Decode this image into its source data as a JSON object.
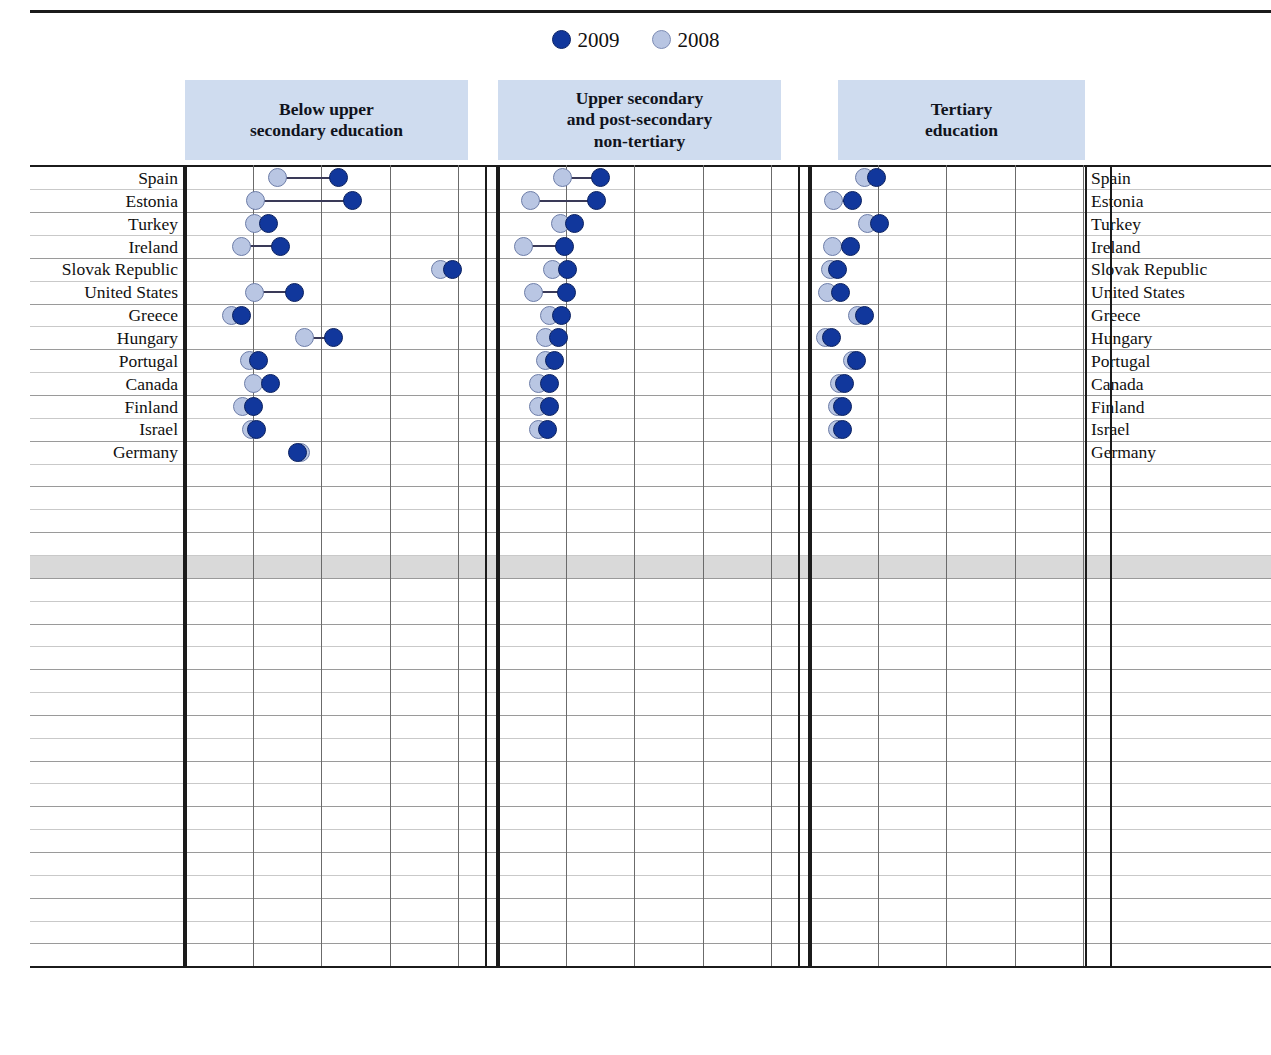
{
  "legend": {
    "items": [
      {
        "label": "2009",
        "color": "#11379c",
        "icon": "filled-circle-icon"
      },
      {
        "label": "2008",
        "color": "#b9c6e3",
        "icon": "light-circle-icon"
      }
    ]
  },
  "panels": [
    {
      "id": "below-upper-secondary",
      "title": "Below upper\nsecondary education",
      "title_line1": "Below upper",
      "title_line2": "secondary education"
    },
    {
      "id": "upper-secondary-post-secondary-non-tertiary",
      "title_line1": "Upper secondary",
      "title_line2": "and post-secondary",
      "title_line3": "non-tertiary"
    },
    {
      "id": "tertiary-education",
      "title_line1": "Tertiary",
      "title_line2": "education"
    }
  ],
  "axis": {
    "ticks": [
      "0",
      "10",
      "20",
      "30",
      "40"
    ],
    "tick_values": [
      0,
      10,
      20,
      30,
      40
    ],
    "title": "Percentage points",
    "min": 0,
    "max": 44
  },
  "highlight_row": "OECD average",
  "chart_data": {
    "type": "scatter",
    "title": "",
    "xlabel": "Percentage points",
    "ylabel": "",
    "xlim": [
      0,
      44
    ],
    "grid": true,
    "legend_position": "top",
    "series": [
      "2008",
      "2009"
    ],
    "panels": [
      "Below upper secondary education",
      "Upper secondary and post-secondary non-tertiary",
      "Tertiary education"
    ],
    "categories": [
      "Spain",
      "Estonia",
      "Turkey",
      "Ireland",
      "Slovak Republic",
      "United States",
      "Greece",
      "Hungary",
      "Portugal",
      "Canada",
      "Finland",
      "Israel",
      "Germany",
      "Chile",
      "Poland",
      "Brazil",
      "France",
      "OECD average",
      "Belgium",
      "Sweden",
      "Japan",
      "Italy",
      "Slovenia",
      "Czech Republic",
      "Denmark",
      "Mexico",
      "Australia",
      "New Zealand",
      "Korea",
      "Austria",
      "United Kingdom",
      "Luxembourg",
      "Switzerland",
      "Netherlands",
      "Norway"
    ],
    "rows": [
      {
        "country": "Spain",
        "below": {
          "y2008": 13.5,
          "y2009": 22.5
        },
        "upper": {
          "y2008": 9.5,
          "y2009": 15.0
        },
        "tertiary": {
          "y2008": 8.0,
          "y2009": 9.8
        }
      },
      {
        "country": "Estonia",
        "below": {
          "y2008": 10.3,
          "y2009": 24.5
        },
        "upper": {
          "y2008": 4.8,
          "y2009": 14.5
        },
        "tertiary": {
          "y2008": 3.5,
          "y2009": 6.3
        }
      },
      {
        "country": "Turkey",
        "below": {
          "y2008": 10.2,
          "y2009": 12.2
        },
        "upper": {
          "y2008": 9.2,
          "y2009": 11.2
        },
        "tertiary": {
          "y2008": 8.5,
          "y2009": 10.2
        }
      },
      {
        "country": "Ireland",
        "below": {
          "y2008": 8.3,
          "y2009": 14.0
        },
        "upper": {
          "y2008": 3.8,
          "y2009": 9.8
        },
        "tertiary": {
          "y2008": 3.3,
          "y2009": 6.0
        }
      },
      {
        "country": "Slovak Republic",
        "below": {
          "y2008": 37.5,
          "y2009": 39.2
        },
        "upper": {
          "y2008": 8.0,
          "y2009": 10.2
        },
        "tertiary": {
          "y2008": 3.0,
          "y2009": 4.0
        }
      },
      {
        "country": "United States",
        "below": {
          "y2008": 10.2,
          "y2009": 16.0
        },
        "upper": {
          "y2008": 5.2,
          "y2009": 10.0
        },
        "tertiary": {
          "y2008": 2.5,
          "y2009": 4.5
        }
      },
      {
        "country": "Greece",
        "below": {
          "y2008": 6.8,
          "y2009": 8.3
        },
        "upper": {
          "y2008": 7.5,
          "y2009": 9.3
        },
        "tertiary": {
          "y2008": 7.0,
          "y2009": 8.0
        }
      },
      {
        "country": "Hungary",
        "below": {
          "y2008": 17.5,
          "y2009": 21.8
        },
        "upper": {
          "y2008": 7.0,
          "y2009": 8.8
        },
        "tertiary": {
          "y2008": 2.3,
          "y2009": 3.2
        }
      },
      {
        "country": "Portugal",
        "below": {
          "y2008": 9.5,
          "y2009": 10.8
        },
        "upper": {
          "y2008": 7.0,
          "y2009": 8.3
        },
        "tertiary": {
          "y2008": 6.3,
          "y2009": 6.8
        }
      },
      {
        "country": "Canada",
        "below": {
          "y2008": 10.0,
          "y2009": 12.5
        },
        "upper": {
          "y2008": 6.0,
          "y2009": 7.5
        },
        "tertiary": {
          "y2008": 4.3,
          "y2009": 5.0
        }
      },
      {
        "country": "Finland",
        "below": {
          "y2008": 8.5,
          "y2009": 10.0
        },
        "upper": {
          "y2008": 6.0,
          "y2009": 7.5
        },
        "tertiary": {
          "y2008": 4.0,
          "y2009": 4.8
        }
      },
      {
        "country": "Israel",
        "below": {
          "y2008": 9.7,
          "y2009": 10.5
        },
        "upper": {
          "y2008": 6.0,
          "y2009": 7.2
        },
        "tertiary": {
          "y2008": 4.0,
          "y2009": 4.8
        }
      },
      {
        "country": "Germany",
        "below": {
          "y2008": 17.0,
          "y2009": 16.5
        },
        "upper": {
          "y2008": 6.3,
          "y2009": 6.0
        },
        "tertiary": {
          "y2008": 3.3,
          "y2009": 3.0
        }
      },
      {
        "country": "Chile",
        "below": {
          "y2008": 5.0,
          "y2009": 5.5
        },
        "upper": {
          "y2008": 6.5,
          "y2009": 7.2
        },
        "tertiary": {
          "y2008": 8.3,
          "y2009": 9.7
        }
      },
      {
        "country": "Poland",
        "below": {
          "y2008": 10.3,
          "y2009": 11.7
        },
        "upper": {
          "y2008": 6.8,
          "y2009": 7.3
        },
        "tertiary": {
          "y2008": 3.8,
          "y2009": 4.2
        }
      },
      {
        "country": "Brazil",
        "below": {
          "y2008": 4.8,
          "y2009": 5.3
        },
        "upper": {
          "y2008": 6.0,
          "y2009": 6.5
        },
        "tertiary": {
          "y2008": 3.0,
          "y2009": 3.3
        }
      },
      {
        "country": "France",
        "below": {
          "y2008": 9.8,
          "y2009": 11.3
        },
        "upper": {
          "y2008": 6.0,
          "y2009": 6.8
        },
        "tertiary": {
          "y2008": 4.5,
          "y2009": 5.2
        }
      },
      {
        "country": "OECD average",
        "below": {
          "y2008": 9.3,
          "y2009": 11.0
        },
        "upper": {
          "y2008": 5.7,
          "y2009": 6.8
        },
        "tertiary": {
          "y2008": 3.3,
          "y2009": 4.0
        }
      },
      {
        "country": "Belgium",
        "below": {
          "y2008": 10.3,
          "y2009": 11.2
        },
        "upper": {
          "y2008": 5.3,
          "y2009": 6.0
        },
        "tertiary": {
          "y2008": 3.3,
          "y2009": 3.8
        }
      },
      {
        "country": "Sweden",
        "below": {
          "y2008": 8.3,
          "y2009": 10.2
        },
        "upper": {
          "y2008": 4.5,
          "y2009": 5.8
        },
        "tertiary": {
          "y2008": 3.3,
          "y2009": 4.0
        }
      },
      {
        "country": "Japan",
        "below": {
          "y2008": null,
          "y2009": null
        },
        "upper": {
          "y2008": 4.5,
          "y2009": 5.5
        },
        "tertiary": {
          "y2008": 3.0,
          "y2009": 3.5
        }
      },
      {
        "country": "Italy",
        "below": {
          "y2008": 7.3,
          "y2009": 8.0
        },
        "upper": {
          "y2008": 4.8,
          "y2009": 5.5
        },
        "tertiary": {
          "y2008": 5.3,
          "y2009": 5.8
        }
      },
      {
        "country": "Slovenia",
        "below": {
          "y2008": 7.0,
          "y2009": 8.0
        },
        "upper": {
          "y2008": 4.3,
          "y2009": 5.3
        },
        "tertiary": {
          "y2008": 3.0,
          "y2009": 3.2
        }
      },
      {
        "country": "Czech Republic",
        "below": {
          "y2008": 17.3,
          "y2009": 21.5
        },
        "upper": {
          "y2008": 4.0,
          "y2009": 5.0
        },
        "tertiary": {
          "y2008": 2.0,
          "y2009": 2.5
        }
      },
      {
        "country": "Denmark",
        "below": {
          "y2008": 5.8,
          "y2009": 8.3
        },
        "upper": {
          "y2008": 3.8,
          "y2009": 5.3
        },
        "tertiary": {
          "y2008": 3.0,
          "y2009": 4.0
        }
      },
      {
        "country": "Mexico",
        "below": {
          "y2008": 4.0,
          "y2009": 5.0
        },
        "upper": {
          "y2008": 4.3,
          "y2009": 5.3
        },
        "tertiary": {
          "y2008": 3.5,
          "y2009": 4.3
        }
      },
      {
        "country": "Australia",
        "below": {
          "y2008": 6.3,
          "y2009": 7.3
        },
        "upper": {
          "y2008": 3.5,
          "y2009": 4.5
        },
        "tertiary": {
          "y2008": 2.8,
          "y2009": 3.8
        }
      },
      {
        "country": "New Zealand",
        "below": {
          "y2008": 5.5,
          "y2009": 7.0
        },
        "upper": {
          "y2008": 3.5,
          "y2009": 4.3
        },
        "tertiary": {
          "y2008": 2.8,
          "y2009": 3.5
        }
      },
      {
        "country": "Korea",
        "below": {
          "y2008": 4.0,
          "y2009": 4.0
        },
        "upper": {
          "y2008": 3.5,
          "y2009": 4.0
        },
        "tertiary": {
          "y2008": 3.0,
          "y2009": 3.5
        }
      },
      {
        "country": "Austria",
        "below": {
          "y2008": 7.3,
          "y2009": 9.3
        },
        "upper": {
          "y2008": 3.3,
          "y2009": 3.8
        },
        "tertiary": {
          "y2008": 2.3,
          "y2009": 2.8
        }
      },
      {
        "country": "United Kingdom",
        "below": {
          "y2008": 6.3,
          "y2009": 6.3
        },
        "upper": {
          "y2008": 3.3,
          "y2009": 3.5
        },
        "tertiary": {
          "y2008": 2.5,
          "y2009": 3.3
        }
      },
      {
        "country": "Luxembourg",
        "below": {
          "y2008": 5.5,
          "y2009": 6.0
        },
        "upper": {
          "y2008": 4.5,
          "y2009": 3.3
        },
        "tertiary": {
          "y2008": 2.5,
          "y2009": 3.3
        }
      },
      {
        "country": "Switzerland",
        "below": {
          "y2008": 7.0,
          "y2009": 8.3
        },
        "upper": {
          "y2008": 3.0,
          "y2009": 3.0
        },
        "tertiary": {
          "y2008": 2.3,
          "y2009": 2.8
        }
      },
      {
        "country": "Netherlands",
        "below": {
          "y2008": 4.3,
          "y2009": 4.8
        },
        "upper": {
          "y2008": 2.3,
          "y2009": 2.8
        },
        "tertiary": {
          "y2008": 2.0,
          "y2009": 2.0
        }
      },
      {
        "country": "Norway",
        "below": {
          "y2008": 5.3,
          "y2009": 5.8
        },
        "upper": {
          "y2008": 1.5,
          "y2009": 1.5
        },
        "tertiary": {
          "y2008": 1.8,
          "y2009": 1.8
        }
      }
    ]
  }
}
